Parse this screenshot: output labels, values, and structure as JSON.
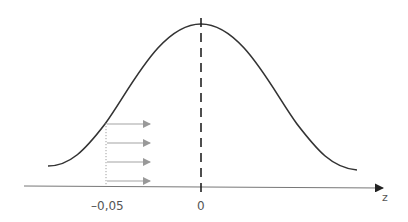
{
  "diagram": {
    "type": "normal-distribution-shift",
    "axis": {
      "label": "z",
      "ticks": [
        {
          "value": -0.05,
          "label": "–0,05"
        },
        {
          "value": 0,
          "label": "0"
        }
      ]
    },
    "curve": {
      "description": "bell curve (standard normal density)"
    },
    "mean_line": {
      "position": "0",
      "style": "dashed"
    },
    "marker_line": {
      "position": "–0,05",
      "style": "dotted"
    },
    "arrows": {
      "count": 4,
      "direction": "right",
      "color": "#999999"
    },
    "colors": {
      "curve": "#333333",
      "axis": "#777777",
      "arrows": "#999999",
      "text": "#555555"
    }
  }
}
